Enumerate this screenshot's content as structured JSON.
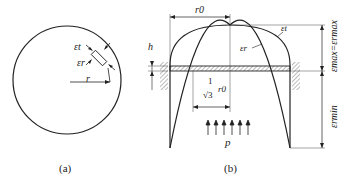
{
  "figure_a": {
    "caption": "(a)",
    "labels": {
      "eps_t": "εt",
      "eps_r": "εr",
      "radius": "r"
    }
  },
  "figure_b": {
    "caption": "(b)",
    "labels": {
      "r0": "r0",
      "h": "h",
      "eps_t": "εt",
      "eps_r": "εr",
      "frac_num": "1",
      "frac_den": "√3",
      "frac_r0": "r0",
      "pressure": "p",
      "eps_max": "εmax=εrmax",
      "eps_min": "εrmin"
    }
  },
  "colors": {
    "line": "#222222",
    "hatch": "#555555"
  }
}
